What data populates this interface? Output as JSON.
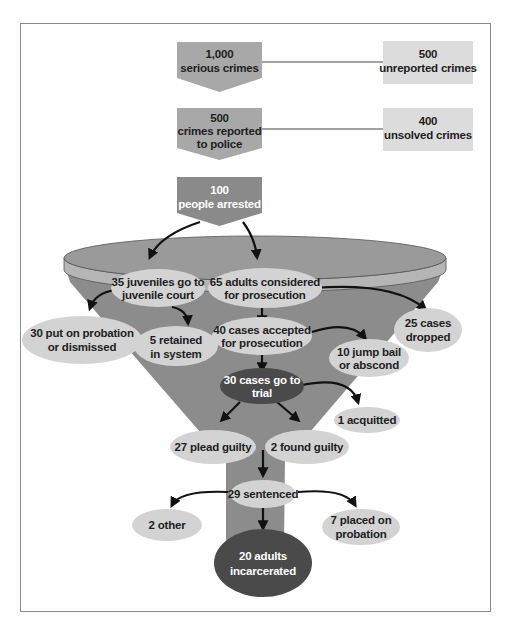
{
  "diagram": {
    "colors": {
      "stage_box": "#a8a8a8",
      "side_box": "#dcdcdc",
      "arrested_box": "#8a8a8a",
      "funnel_body": "#8c8c8c",
      "funnel_top": "#9a9a9a",
      "funnel_rim": "#b5b5b5",
      "ellipse_light": "#d3d3d3",
      "ellipse_dark": "#4a4a4a",
      "arrow": "#111111",
      "frame": "#8a8a8a"
    },
    "stages": [
      {
        "id": "serious",
        "line1": "1,000",
        "line2": "serious crimes"
      },
      {
        "id": "reported",
        "line1": "500",
        "line2": "crimes reported",
        "line3": "to police"
      },
      {
        "id": "arrested",
        "line1": "100",
        "line2": "people arrested"
      }
    ],
    "side_boxes": [
      {
        "id": "unreported",
        "line1": "500",
        "line2": "unreported crimes"
      },
      {
        "id": "unsolved",
        "line1": "400",
        "line2": "unsolved crimes"
      }
    ],
    "nodes": {
      "juveniles": {
        "line1": "35 juveniles go to",
        "line2": "juvenile court"
      },
      "adults": {
        "line1": "65 adults considered",
        "line2": "for prosecution"
      },
      "probation_dismissed": {
        "line1": "30 put on probation",
        "line2": "or dismissed"
      },
      "retained": {
        "line1": "5 retained",
        "line2": "in system"
      },
      "accepted": {
        "line1": "40 cases accepted",
        "line2": "for prosecution"
      },
      "dropped": {
        "line1": "25 cases",
        "line2": "dropped"
      },
      "jump_bail": {
        "line1": "10 jump bail",
        "line2": "or abscond"
      },
      "trial": {
        "line1": "30 cases go to",
        "line2": "trial"
      },
      "acquitted": {
        "line1": "1 acquitted"
      },
      "plead_guilty": {
        "line1": "27 plead guilty"
      },
      "found_guilty": {
        "line1": "2 found guilty"
      },
      "sentenced": {
        "line1": "29 sentenced"
      },
      "other": {
        "line1": "2 other"
      },
      "placed_probation": {
        "line1": "7 placed on",
        "line2": "probation"
      },
      "incarcerated": {
        "line1": "20 adults",
        "line2": "incarcerated"
      }
    }
  }
}
